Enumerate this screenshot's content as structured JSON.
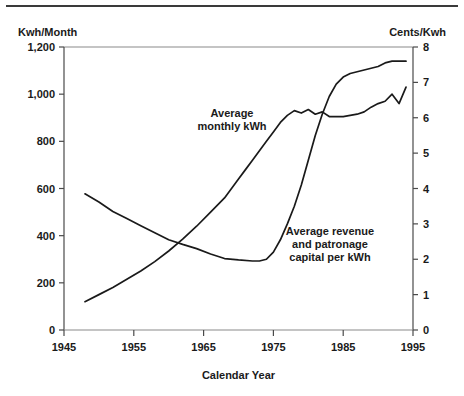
{
  "chart_data": {
    "type": "line",
    "title": "",
    "xlabel": "Calendar Year",
    "ylabel": "Kwh/Month",
    "y2label": "Cents/Kwh",
    "grid": false,
    "legend": "none",
    "xlim": [
      1945,
      1995
    ],
    "ylim": [
      0,
      1200
    ],
    "y2lim": [
      0,
      8
    ],
    "xticks": [
      1945,
      1955,
      1965,
      1975,
      1985,
      1995
    ],
    "xticklabels": [
      "1945",
      "1955",
      "1965",
      "1975",
      "1985",
      "1995"
    ],
    "yticks": [
      0,
      200,
      400,
      600,
      800,
      1000,
      1200
    ],
    "yticklabels": [
      "0",
      "200",
      "400",
      "600",
      "800",
      "1,000",
      "1,200"
    ],
    "y2ticks": [
      0,
      1,
      2,
      3,
      4,
      5,
      6,
      7,
      8
    ],
    "y2ticklabels": [
      "0",
      "1",
      "2",
      "3",
      "4",
      "5",
      "6",
      "7",
      "8"
    ],
    "series": [
      {
        "name": "Average monthly kWh",
        "axis": "left",
        "units": "Kwh/Month",
        "x": [
          1948,
          1950,
          1952,
          1954,
          1956,
          1958,
          1960,
          1962,
          1964,
          1966,
          1968,
          1970,
          1971,
          1972,
          1973,
          1974,
          1975,
          1976,
          1977,
          1978,
          1979,
          1980,
          1981,
          1982,
          1983,
          1984,
          1985,
          1986,
          1987,
          1988,
          1989,
          1990,
          1991,
          1992,
          1993,
          1994
        ],
        "values": [
          120,
          150,
          180,
          215,
          250,
          290,
          335,
          385,
          440,
          500,
          560,
          640,
          680,
          720,
          760,
          800,
          840,
          880,
          910,
          930,
          920,
          935,
          915,
          925,
          905,
          905,
          905,
          910,
          915,
          925,
          945,
          960,
          970,
          1000,
          960,
          1030
        ]
      },
      {
        "name": "Average revenue and patronage capital per kWh",
        "axis": "right",
        "units": "Cents/Kwh",
        "x": [
          1948,
          1950,
          1952,
          1954,
          1956,
          1958,
          1960,
          1962,
          1964,
          1966,
          1968,
          1970,
          1972,
          1973,
          1974,
          1975,
          1976,
          1977,
          1978,
          1979,
          1980,
          1981,
          1982,
          1983,
          1984,
          1985,
          1986,
          1987,
          1988,
          1989,
          1990,
          1991,
          1992,
          1993,
          1994
        ],
        "values": [
          3.85,
          3.62,
          3.35,
          3.15,
          2.95,
          2.75,
          2.55,
          2.42,
          2.3,
          2.15,
          2.02,
          1.98,
          1.95,
          1.95,
          2.0,
          2.2,
          2.55,
          3.0,
          3.5,
          4.1,
          4.8,
          5.5,
          6.1,
          6.6,
          6.95,
          7.15,
          7.25,
          7.3,
          7.35,
          7.4,
          7.45,
          7.55,
          7.6,
          7.6,
          7.6
        ]
      }
    ],
    "annotations": [
      {
        "id": "annot-kwh",
        "lines": [
          "Average",
          "monthly kWh"
        ],
        "x": 232,
        "y": 117
      },
      {
        "id": "annot-revenue",
        "lines": [
          "Average revenue",
          "and patronage",
          "capital per kWh"
        ],
        "x": 330,
        "y": 235
      }
    ]
  }
}
